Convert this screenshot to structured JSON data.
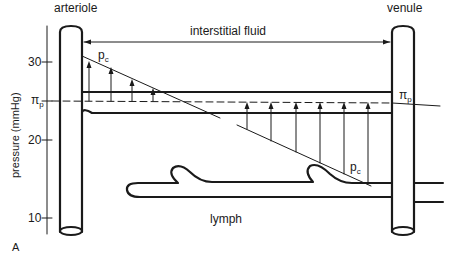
{
  "figure": {
    "panel_label": "A",
    "labels": {
      "arteriole": "arteriole",
      "venule": "venule",
      "interstitial_fluid": "interstitial fluid",
      "lymph": "lymph",
      "pc_top": {
        "main": "p",
        "sub": "c"
      },
      "pc_bottom": {
        "main": "p",
        "sub": "c"
      },
      "pi_p_left": {
        "main": "π",
        "sub": "p"
      },
      "pi_p_right": {
        "main": "π",
        "sub": "p"
      }
    },
    "y_axis": {
      "label": "pressure (mmHg)",
      "ticks": [
        {
          "value": "30",
          "y": 62
        },
        {
          "value": "20",
          "y": 140
        },
        {
          "value": "10",
          "y": 218
        }
      ]
    },
    "colors": {
      "ink": "#1a1a1a",
      "background": "#ffffff"
    }
  }
}
